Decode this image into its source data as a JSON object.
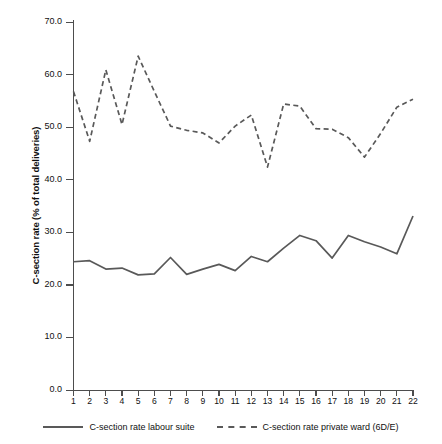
{
  "chart_data": {
    "type": "line",
    "title": "",
    "xlabel": "",
    "ylabel": "C-section rate (% of total deliveries)",
    "ylim": [
      0.0,
      70.0
    ],
    "xlim": [
      1,
      22
    ],
    "grid": false,
    "legend_position": "bottom",
    "y_ticks": [
      "0.0",
      "10.0",
      "20.0",
      "30.0",
      "40.0",
      "50.0",
      "60.0",
      "70.0"
    ],
    "y_tick_values": [
      0.0,
      10.0,
      20.0,
      30.0,
      40.0,
      50.0,
      60.0,
      70.0
    ],
    "x": [
      1,
      2,
      3,
      4,
      5,
      6,
      7,
      8,
      9,
      10,
      11,
      12,
      13,
      14,
      15,
      16,
      17,
      18,
      19,
      20,
      21,
      22
    ],
    "categories": [
      "1",
      "2",
      "3",
      "4",
      "5",
      "6",
      "7",
      "8",
      "9",
      "10",
      "11",
      "12",
      "13",
      "14",
      "15",
      "16",
      "17",
      "18",
      "19",
      "20",
      "21",
      "22"
    ],
    "series": [
      {
        "name": "C-section rate labour suite",
        "style": "solid",
        "color": "#595959",
        "values": [
          24.4,
          24.6,
          23.0,
          23.2,
          21.9,
          22.1,
          25.2,
          22.0,
          23.0,
          23.9,
          22.7,
          25.4,
          24.4,
          27.0,
          29.4,
          28.4,
          25.1,
          29.4,
          28.2,
          27.2,
          25.9,
          33.1
        ]
      },
      {
        "name": "C-section rate private ward (6D/E)",
        "style": "dashed",
        "color": "#595959",
        "values": [
          56.8,
          47.3,
          60.9,
          50.5,
          63.5,
          56.8,
          50.2,
          49.4,
          48.9,
          47.0,
          50.2,
          52.3,
          42.4,
          54.4,
          54.0,
          49.7,
          49.6,
          48.0,
          44.3,
          48.8,
          53.8,
          55.3
        ]
      }
    ]
  },
  "legend": {
    "entries": [
      {
        "label": "C-section rate labour suite",
        "style": "solid"
      },
      {
        "label": "C-section rate private ward (6D/E)",
        "style": "dashed"
      }
    ]
  }
}
